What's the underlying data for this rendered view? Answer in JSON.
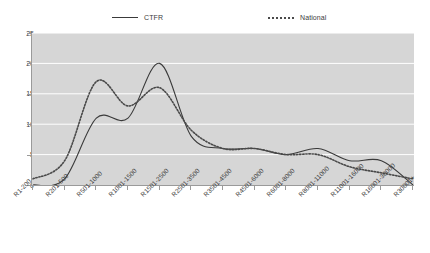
{
  "chart_data": {
    "type": "line",
    "title": "",
    "subtitle": "",
    "xlabel": "",
    "ylabel": "",
    "ylim": [
      0,
      25
    ],
    "yticks": [
      0,
      5,
      10,
      15,
      20,
      25
    ],
    "grid": true,
    "grid_axis": "y",
    "grid_color": "#ffffff",
    "plot_background": "#d6d6d6",
    "legend_position": "top",
    "smoothing": "spline",
    "categories": [
      "R1-200",
      "R201-500",
      "R501-1000",
      "R1001-1500",
      "R1501-2500",
      "R2501-3500",
      "R3501-4500",
      "R4501-6000",
      "R6001-8000",
      "R8001-11000",
      "R11001-16000",
      "R16001-30000",
      "R30001+"
    ],
    "series": [
      {
        "name": "CTFR",
        "style": "solid",
        "color": "#3a3a3a",
        "values": [
          0,
          1,
          11,
          11,
          20,
          8,
          6,
          6,
          5,
          6,
          4,
          4,
          0
        ]
      },
      {
        "name": "National",
        "style": "dotted",
        "color": "#4a4a4a",
        "values": [
          1,
          4,
          17,
          13,
          16,
          9,
          6,
          6,
          5,
          5,
          3,
          2,
          1
        ]
      }
    ]
  },
  "legend": {
    "entries": [
      {
        "label": "CTFR"
      },
      {
        "label": "National"
      }
    ]
  },
  "axes": {
    "y": {
      "labels": [
        "25",
        "20",
        "15",
        "10",
        "5",
        "0"
      ]
    },
    "x": {
      "labels": [
        "R1-200",
        "R201-500",
        "R501-1000",
        "R1001-1500",
        "R1501-2500",
        "R2501-3500",
        "R3501-4500",
        "R4501-6000",
        "R6001-8000",
        "R8001-11000",
        "R11001-16000",
        "R16001-30000",
        "R30001+"
      ]
    }
  }
}
